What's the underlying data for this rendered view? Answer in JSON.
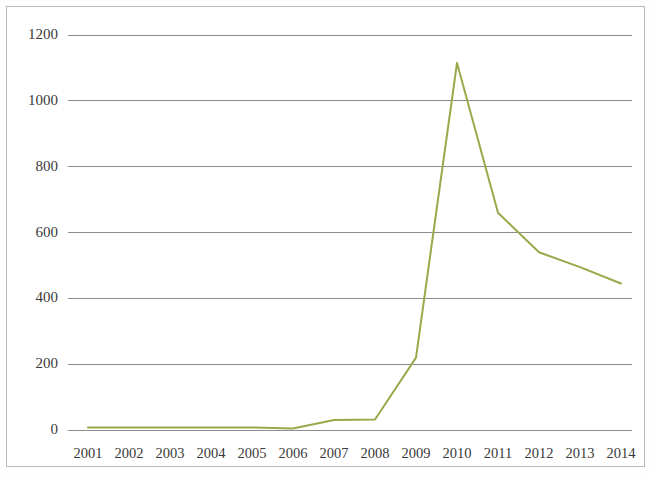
{
  "chart_data": {
    "type": "line",
    "title": "",
    "subtitle": "",
    "xlabel": "",
    "ylabel": "",
    "grid": true,
    "legend": false,
    "legend_position": "none",
    "line_color": "#9aa84a",
    "gridline_color": "#8c8c8c",
    "axis_color": "#8c8c8c",
    "border_color": "#b9b9b9",
    "background_color": "#ffffff",
    "xlim": [
      2001,
      2014
    ],
    "ylim": [
      0,
      1200
    ],
    "yticks": [
      0,
      200,
      400,
      600,
      800,
      1000,
      1200
    ],
    "ytick_labels": [
      "0",
      "200",
      "400",
      "600",
      "800",
      "1000",
      "1200"
    ],
    "categories": [
      2001,
      2002,
      2003,
      2004,
      2005,
      2006,
      2007,
      2008,
      2009,
      2010,
      2011,
      2012,
      2013,
      2014
    ],
    "xtick_labels": [
      "2001",
      "2002",
      "2003",
      "2004",
      "2005",
      "2006",
      "2007",
      "2008",
      "2009",
      "2010",
      "2011",
      "2012",
      "2013",
      "2014"
    ],
    "series": [
      {
        "name": "series-1",
        "color": "#9aa84a",
        "values": [
          8,
          8,
          8,
          8,
          8,
          5,
          30,
          32,
          220,
          1115,
          660,
          540,
          495,
          445
        ]
      }
    ]
  }
}
